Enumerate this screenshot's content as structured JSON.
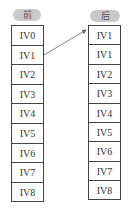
{
  "left": {
    "header": "前",
    "cells": [
      "IV0",
      "IV1",
      "IV2",
      "IV3",
      "IV4",
      "IV5",
      "IV6",
      "IV7",
      "IV8"
    ]
  },
  "right": {
    "header": "后",
    "cells": [
      "IV1",
      "IV1",
      "IV2",
      "IV3",
      "IV4",
      "IV5",
      "IV6",
      "IV7",
      "IV8"
    ]
  },
  "arrow": {
    "from": "left.IV1",
    "to": "right.IV0-slot"
  },
  "colors": {
    "header_bg": "#c9c9c9",
    "border": "#444444",
    "arrow": "#666666"
  }
}
